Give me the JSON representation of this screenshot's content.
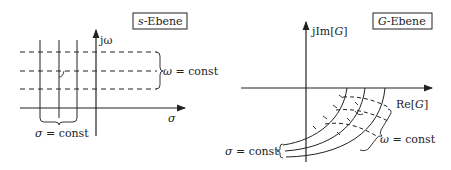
{
  "left_panel": {
    "title_var": "s",
    "title_rest": "-Ebene",
    "axis_y_label": "jω",
    "axis_x_label": "σ",
    "brace_right_label": "ω = const",
    "brace_bottom_label": "σ = const"
  },
  "right_panel": {
    "title_var": "G",
    "title_rest": "-Ebene",
    "axis_y_label": "jIm[G]",
    "axis_x_label": "Re[G]",
    "brace_right_label": "ω = const",
    "brace_left_label": "σ = const"
  },
  "colors": {
    "ink": "#222222",
    "background": "#ffffff"
  }
}
